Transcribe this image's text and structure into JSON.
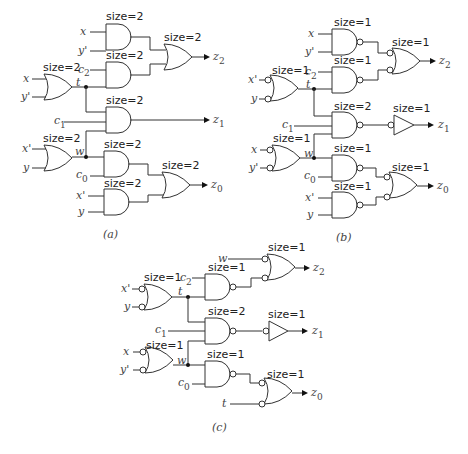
{
  "figure": {
    "captions": {
      "a": "(a)",
      "b": "(b)",
      "c": "(c)"
    },
    "size_labels": {
      "s1": "size=1",
      "s2": "size=2"
    },
    "signals": {
      "x": "x",
      "x_prime": "x'",
      "y": "y",
      "y_prime": "y'",
      "t": "t",
      "w": "w",
      "c": "c",
      "z": "z",
      "sub0": "0",
      "sub1": "1",
      "sub2": "2"
    }
  },
  "diagrams": [
    {
      "id": "a",
      "description": "AND/OR implementation",
      "gates": [
        {
          "type": "AND",
          "size": 2,
          "inputs": [
            "x",
            "y'"
          ]
        },
        {
          "type": "OR",
          "size": 2,
          "inputs": [
            "x",
            "y'"
          ],
          "output": "t"
        },
        {
          "type": "AND",
          "size": 2,
          "inputs": [
            "c2",
            "t"
          ]
        },
        {
          "type": "OR",
          "size": 2,
          "output": "z2"
        },
        {
          "type": "AND",
          "size": 2,
          "inputs": [
            "t",
            "c1",
            "w"
          ],
          "output": "z1"
        },
        {
          "type": "OR",
          "size": 2,
          "inputs": [
            "x'",
            "y"
          ],
          "output": "w"
        },
        {
          "type": "AND",
          "size": 2,
          "inputs": [
            "w",
            "c0"
          ]
        },
        {
          "type": "AND",
          "size": 2,
          "inputs": [
            "x'",
            "y"
          ]
        },
        {
          "type": "OR",
          "size": 2,
          "output": "z0"
        }
      ]
    },
    {
      "id": "b",
      "description": "NAND implementation",
      "gates": [
        {
          "type": "NAND",
          "size": 1,
          "inputs": [
            "x",
            "y'"
          ]
        },
        {
          "type": "NAND-OR",
          "size": 1,
          "inputs": [
            "x'",
            "y"
          ],
          "output": "t"
        },
        {
          "type": "NAND",
          "size": 1,
          "inputs": [
            "c2",
            "t"
          ]
        },
        {
          "type": "NAND-OR",
          "size": 1,
          "output": "z2"
        },
        {
          "type": "NAND",
          "size": 2,
          "inputs": [
            "t",
            "c1",
            "w"
          ]
        },
        {
          "type": "INV",
          "size": 1,
          "output": "z1"
        },
        {
          "type": "NAND-OR",
          "size": 1,
          "inputs": [
            "x",
            "y'"
          ],
          "output": "w"
        },
        {
          "type": "NAND",
          "size": 1,
          "inputs": [
            "w",
            "c0"
          ]
        },
        {
          "type": "NAND",
          "size": 1,
          "inputs": [
            "x'",
            "y"
          ]
        },
        {
          "type": "NAND-OR",
          "size": 1,
          "output": "z0"
        }
      ]
    },
    {
      "id": "c",
      "description": "Optimized NAND implementation",
      "gates": [
        {
          "type": "NAND-OR",
          "size": 1,
          "inputs": [
            "x'",
            "y"
          ],
          "output": "t"
        },
        {
          "type": "NAND",
          "size": 1,
          "inputs": [
            "c2",
            "t"
          ]
        },
        {
          "type": "NAND-OR",
          "size": 1,
          "inputs": [
            "w"
          ],
          "output": "z2"
        },
        {
          "type": "NAND",
          "size": 2,
          "inputs": [
            "t",
            "c1",
            "w"
          ]
        },
        {
          "type": "INV",
          "size": 1,
          "output": "z1"
        },
        {
          "type": "NAND-OR",
          "size": 1,
          "inputs": [
            "x",
            "y'"
          ],
          "output": "w"
        },
        {
          "type": "NAND",
          "size": 1,
          "inputs": [
            "w",
            "c0"
          ]
        },
        {
          "type": "NAND-OR",
          "size": 1,
          "inputs": [
            "t"
          ],
          "output": "z0"
        }
      ]
    }
  ]
}
